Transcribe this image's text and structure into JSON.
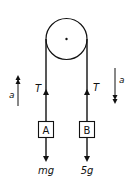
{
  "diagram": {
    "type": "atwood-machine-free-body",
    "pulley": {
      "center_x": 66,
      "center_y": 39,
      "radius": 21
    },
    "labels": {
      "tension_left": "T",
      "tension_right": "T",
      "accel_left": "a",
      "accel_right": "a",
      "block_a": "A",
      "block_b": "B",
      "weight_a": "mg",
      "weight_b": "5g"
    },
    "colors": {
      "stroke": "#111111",
      "background": "#ffffff"
    }
  }
}
